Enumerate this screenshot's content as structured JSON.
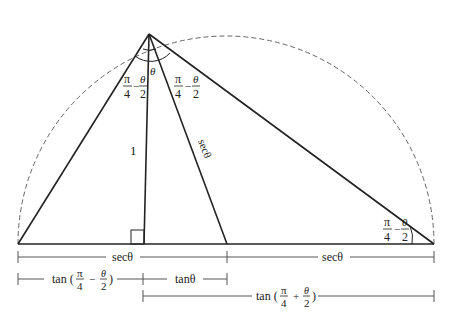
{
  "diagram": {
    "colors": {
      "line": "#222222",
      "dim": "#555555",
      "dashed": "#666666",
      "background": "#ffffff"
    },
    "labels": {
      "apex_angle": "θ",
      "left_angle_num": "π",
      "left_angle_den": "4",
      "left_angle_minus": "−",
      "left_angle_num2": "θ",
      "left_angle_den2": "2",
      "right_angle_num": "π",
      "right_angle_den": "4",
      "right_angle_minus": "−",
      "right_angle_num2": "θ",
      "right_angle_den2": "2",
      "corner_angle_num": "π",
      "corner_angle_den": "4",
      "corner_angle_minus": "−",
      "corner_angle_num2": "θ",
      "corner_angle_den2": "2",
      "height": "1",
      "hypotenuse": "secθ"
    },
    "dimensions": {
      "row1_left": "secθ",
      "row1_right": "secθ",
      "row2_left_prefix": "tan (",
      "row2_left_num1": "π",
      "row2_left_den1": "4",
      "row2_left_op": "−",
      "row2_left_num2": "θ",
      "row2_left_den2": "2",
      "row2_left_suffix": ")",
      "row2_right": "tanθ",
      "row3_prefix": "tan (",
      "row3_num1": "π",
      "row3_den1": "4",
      "row3_op": "+",
      "row3_num2": "θ",
      "row3_den2": "2",
      "row3_suffix": ")"
    }
  }
}
